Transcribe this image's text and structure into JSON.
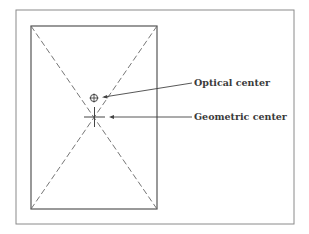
{
  "diagram": {
    "labels": {
      "optical_center": "Optical center",
      "geometric_center": "Geometric center"
    },
    "colors": {
      "stroke": "#555555",
      "frame": "#8a8a8a",
      "text": "#3a3a3a"
    }
  }
}
